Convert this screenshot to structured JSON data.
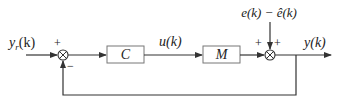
{
  "diagram": {
    "type": "feedback-control-block-diagram",
    "input": {
      "label": "y",
      "subscript": "r",
      "arg": "(k)"
    },
    "summing_junction_1": {
      "plus_sign": "+",
      "minus_sign": "−"
    },
    "controller_block": {
      "label": "C"
    },
    "control_signal": {
      "label": "u(k)"
    },
    "plant_block": {
      "label": "M"
    },
    "disturbance": {
      "label": "e(k) − ê(k)"
    },
    "summing_junction_2": {
      "plus_left": "+",
      "plus_top": "+"
    },
    "output": {
      "label": "y(k)"
    },
    "colors": {
      "line": "#333333",
      "block_border": "#666666",
      "text": "#222222"
    }
  }
}
